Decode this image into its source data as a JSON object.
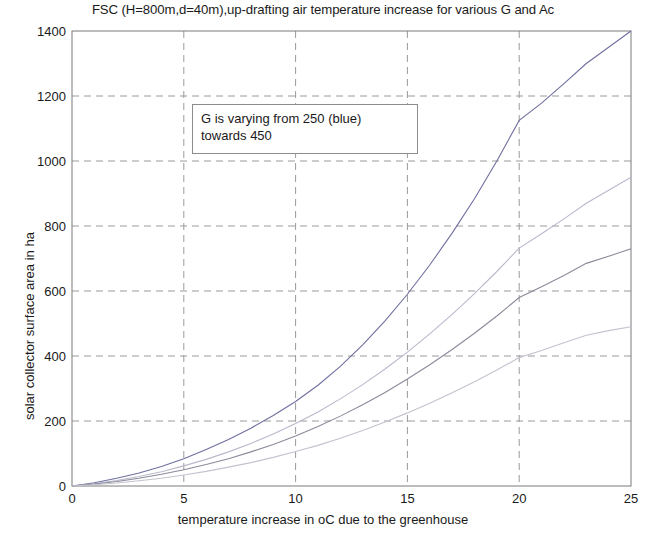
{
  "chart_data": {
    "type": "line",
    "title": "FSC (H=800m,d=40m),up-drafting air temperature increase for various G and Ac",
    "xlabel": "temperature increase in oC due to the greenhouse",
    "ylabel": "solar collector surface area in ha",
    "xlim": [
      0,
      25
    ],
    "ylim": [
      0,
      1400
    ],
    "xticks": [
      0,
      5,
      10,
      15,
      20,
      25
    ],
    "yticks": [
      0,
      200,
      400,
      600,
      800,
      1000,
      1200,
      1400
    ],
    "xtick_labels": [
      "0",
      "5",
      "10",
      "15",
      "20",
      "25"
    ],
    "ytick_labels": [
      "0",
      "200",
      "400",
      "600",
      "800",
      "1000",
      "1200",
      "1400"
    ],
    "grid": true,
    "grid_style": "dashed",
    "legend": "none",
    "annotations": [
      {
        "line1": "G is varying from 250 (blue)",
        "line2": "towards 450",
        "x": 3.3,
        "y": 1180
      }
    ],
    "x": [
      0,
      1,
      2,
      3,
      4,
      5,
      6,
      7,
      8,
      9,
      10,
      11,
      12,
      13,
      14,
      15,
      16,
      17,
      18,
      19,
      20,
      21,
      22,
      23,
      24,
      25
    ],
    "series": [
      {
        "name": "G = 250",
        "color": "#6f6f9f",
        "values": [
          0,
          10,
          24,
          40,
          60,
          84,
          112,
          143,
          178,
          217,
          260,
          310,
          368,
          434,
          508,
          590,
          680,
          778,
          884,
          1000,
          1125,
          1178,
          1238,
          1300,
          1350,
          1400
        ]
      },
      {
        "name": "G = 320",
        "color": "#b9b9cc",
        "values": [
          0,
          7,
          17,
          29,
          44,
          62,
          82,
          105,
          131,
          160,
          192,
          228,
          268,
          312,
          360,
          412,
          468,
          528,
          592,
          660,
          732,
          776,
          822,
          870,
          910,
          950
        ]
      },
      {
        "name": "G = 390",
        "color": "#8a8a9a",
        "values": [
          0,
          6,
          14,
          24,
          36,
          50,
          66,
          84,
          105,
          128,
          154,
          183,
          215,
          250,
          288,
          329,
          373,
          420,
          470,
          523,
          580,
          613,
          648,
          685,
          707,
          730
        ]
      },
      {
        "name": "G = 450",
        "color": "#c3c3cf",
        "values": [
          0,
          4,
          9,
          16,
          24,
          34,
          45,
          58,
          72,
          88,
          106,
          125,
          147,
          171,
          197,
          225,
          255,
          287,
          321,
          357,
          395,
          417,
          441,
          464,
          478,
          490
        ]
      }
    ]
  }
}
